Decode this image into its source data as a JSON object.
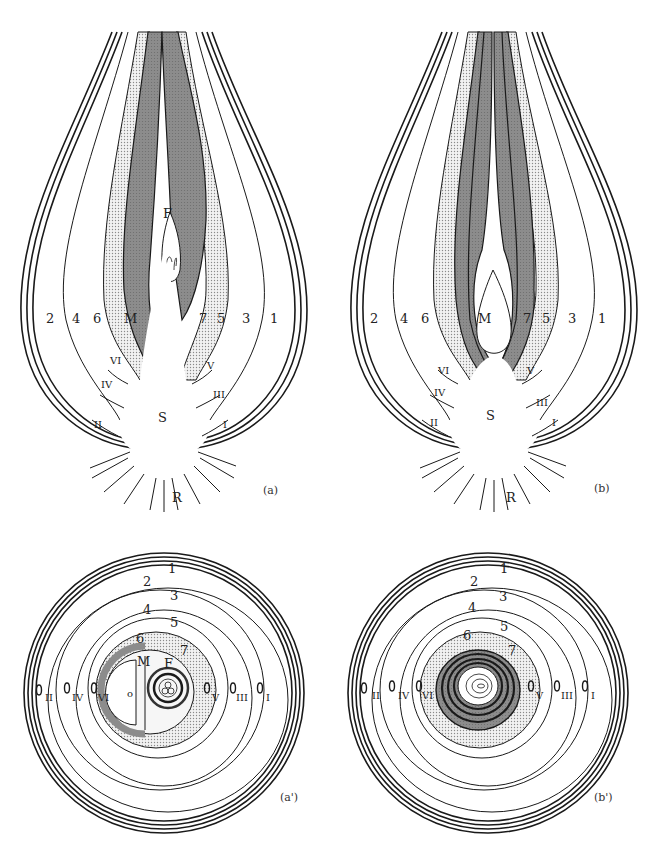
{
  "figure": {
    "panels": [
      {
        "id": "a",
        "caption": "(a)",
        "view": "longitudinal",
        "scale_labels": [
          "1",
          "2",
          "3",
          "4",
          "5",
          "6",
          "7"
        ],
        "bud_labels": [
          "I",
          "II",
          "III",
          "IV",
          "V",
          "VI"
        ],
        "center_labels": {
          "main": "M",
          "flower": "F",
          "stem": "S",
          "roots": "R"
        }
      },
      {
        "id": "b",
        "caption": "(b)",
        "view": "longitudinal",
        "scale_labels": [
          "1",
          "2",
          "3",
          "4",
          "5",
          "6",
          "7"
        ],
        "bud_labels": [
          "I",
          "II",
          "III",
          "IV",
          "V",
          "VI"
        ],
        "center_labels": {
          "main": "M",
          "stem": "S",
          "roots": "R"
        }
      },
      {
        "id": "a_prime",
        "caption": "(a')",
        "view": "cross-section",
        "scale_labels": [
          "1",
          "2",
          "3",
          "4",
          "5",
          "6",
          "7"
        ],
        "bud_labels": [
          "II",
          "IV",
          "VI",
          "V",
          "III",
          "I"
        ],
        "center_labels": {
          "main": "M",
          "flower": "F",
          "inner": "o"
        }
      },
      {
        "id": "b_prime",
        "caption": "(b')",
        "view": "cross-section",
        "scale_labels": [
          "1",
          "2",
          "3",
          "4",
          "5",
          "6",
          "7"
        ],
        "bud_labels": [
          "II",
          "IV",
          "VI",
          "V",
          "III",
          "I"
        ]
      }
    ],
    "colors": {
      "line": "#1a1a1a",
      "dark_scale": "#8a8a8a",
      "stipple": "#d8d8d8",
      "background": "#ffffff"
    }
  }
}
